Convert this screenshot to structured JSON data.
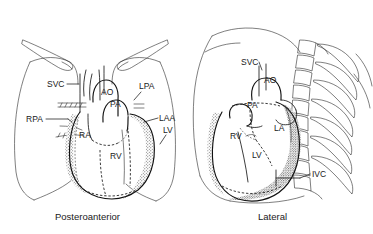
{
  "figure": {
    "background_color": "#ffffff",
    "line_color": "#1a1a1a",
    "shading_color": "#9a9a9a"
  },
  "panels": [
    {
      "id": "posteroanterior",
      "caption": "Posteroanterior",
      "labels": [
        {
          "key": "svc",
          "text": "SVC",
          "full": "superior vena cava",
          "x": 47,
          "y": 87,
          "side": "left"
        },
        {
          "key": "rpa",
          "text": "RPA",
          "full": "right pulmonary artery",
          "x": 26,
          "y": 122,
          "side": "left"
        },
        {
          "key": "ao",
          "text": "AO",
          "full": "aorta",
          "x": 101,
          "y": 95,
          "side": "interior"
        },
        {
          "key": "pa",
          "text": "PA",
          "full": "pulmonary artery",
          "x": 110,
          "y": 107,
          "side": "interior"
        },
        {
          "key": "ra",
          "text": "RA",
          "full": "right atrium",
          "x": 79,
          "y": 138,
          "side": "interior"
        },
        {
          "key": "rv",
          "text": "RV",
          "full": "right ventricle",
          "x": 110,
          "y": 159,
          "side": "interior"
        },
        {
          "key": "lpa",
          "text": "LPA",
          "full": "left pulmonary artery",
          "x": 139,
          "y": 89,
          "side": "right"
        },
        {
          "key": "laa",
          "text": "LAA",
          "full": "left atrial appendage",
          "x": 159,
          "y": 121,
          "side": "right"
        },
        {
          "key": "lv",
          "text": "LV",
          "full": "left ventricle",
          "x": 163,
          "y": 133,
          "side": "right"
        }
      ]
    },
    {
      "id": "lateral",
      "caption": "Lateral",
      "labels": [
        {
          "key": "svc",
          "text": "SVC",
          "full": "superior vena cava",
          "x": 241,
          "y": 65,
          "side": "left"
        },
        {
          "key": "ao",
          "text": "AO",
          "full": "aorta",
          "x": 264,
          "y": 83,
          "side": "interior"
        },
        {
          "key": "pa",
          "text": "PA",
          "full": "pulmonary artery",
          "x": 247,
          "y": 108,
          "side": "interior"
        },
        {
          "key": "rv",
          "text": "RV",
          "full": "right ventricle",
          "x": 230,
          "y": 139,
          "side": "interior"
        },
        {
          "key": "la",
          "text": "LA",
          "full": "left atrium",
          "x": 274,
          "y": 131,
          "side": "interior"
        },
        {
          "key": "lv",
          "text": "LV",
          "full": "left ventricle",
          "x": 252,
          "y": 158,
          "side": "interior"
        },
        {
          "key": "ivc",
          "text": "IVC",
          "full": "inferior vena cava",
          "x": 312,
          "y": 177,
          "side": "right"
        }
      ]
    }
  ]
}
